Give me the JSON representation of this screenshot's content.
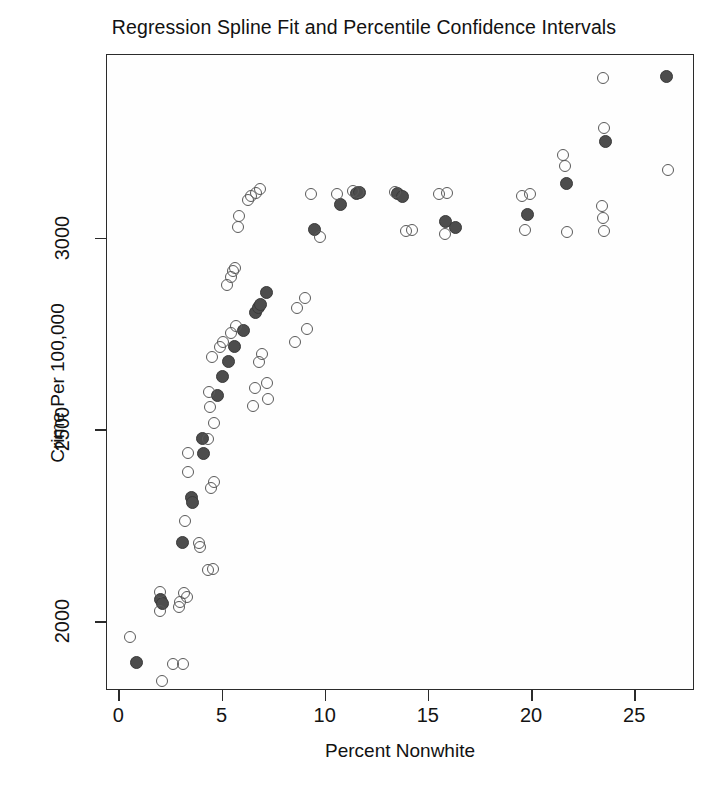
{
  "chart_data": {
    "type": "scatter",
    "title": "Regression Spline Fit and Percentile Confidence Intervals",
    "xlabel": "Percent Nonwhite",
    "ylabel": "Crime Per 100,000",
    "xlim": [
      -0.6,
      27.9
    ],
    "ylim": [
      1820,
      3480
    ],
    "xticks": [
      0,
      5,
      10,
      15,
      20,
      25
    ],
    "yticks": [
      2000,
      2500,
      3000
    ],
    "grid": false,
    "legend": null,
    "series": [
      {
        "name": "Spline fit",
        "marker": "filled-circle",
        "color": "#4d4d4d",
        "points": [
          [
            0.85,
            1895
          ],
          [
            2.0,
            2060
          ],
          [
            2.1,
            2048
          ],
          [
            3.05,
            2207
          ],
          [
            3.5,
            2325
          ],
          [
            3.55,
            2312
          ],
          [
            4.05,
            2478
          ],
          [
            4.1,
            2440
          ],
          [
            4.75,
            2592
          ],
          [
            5.0,
            2640
          ],
          [
            5.3,
            2680
          ],
          [
            5.6,
            2718
          ],
          [
            6.0,
            2762
          ],
          [
            6.6,
            2808
          ],
          [
            6.75,
            2822
          ],
          [
            6.85,
            2830
          ],
          [
            7.15,
            2860
          ],
          [
            9.45,
            3025
          ],
          [
            10.7,
            3090
          ],
          [
            11.5,
            3118
          ],
          [
            11.65,
            3120
          ],
          [
            13.5,
            3118
          ],
          [
            13.7,
            3110
          ],
          [
            15.8,
            3045
          ],
          [
            16.3,
            3030
          ],
          [
            19.8,
            3065
          ],
          [
            21.65,
            3145
          ],
          [
            23.55,
            3255
          ],
          [
            26.5,
            3425
          ]
        ]
      },
      {
        "name": "Percentile confidence interval bounds",
        "marker": "open-circle",
        "color": "#5a5a5a",
        "points": [
          [
            0.5,
            1962
          ],
          [
            1.95,
            2078
          ],
          [
            1.95,
            2030
          ],
          [
            2.05,
            1845
          ],
          [
            2.6,
            1890
          ],
          [
            2.9,
            2040
          ],
          [
            2.95,
            2052
          ],
          [
            3.1,
            1890
          ],
          [
            3.15,
            2075
          ],
          [
            3.3,
            2065
          ],
          [
            3.2,
            2265
          ],
          [
            3.35,
            2440
          ],
          [
            3.35,
            2392
          ],
          [
            3.85,
            2205
          ],
          [
            3.9,
            2195
          ],
          [
            4.3,
            2135
          ],
          [
            4.55,
            2138
          ],
          [
            4.45,
            2350
          ],
          [
            4.6,
            2365
          ],
          [
            4.3,
            2478
          ],
          [
            4.6,
            2520
          ],
          [
            4.35,
            2600
          ],
          [
            4.4,
            2560
          ],
          [
            4.5,
            2692
          ],
          [
            4.9,
            2718
          ],
          [
            5.0,
            2730
          ],
          [
            5.4,
            2755
          ],
          [
            5.65,
            2772
          ],
          [
            5.2,
            2880
          ],
          [
            5.4,
            2900
          ],
          [
            5.5,
            2915
          ],
          [
            5.6,
            2925
          ],
          [
            5.75,
            3030
          ],
          [
            5.8,
            3060
          ],
          [
            6.25,
            3102
          ],
          [
            6.4,
            3112
          ],
          [
            6.6,
            3120
          ],
          [
            6.8,
            3130
          ],
          [
            6.5,
            2565
          ],
          [
            6.55,
            2612
          ],
          [
            6.75,
            2680
          ],
          [
            6.9,
            2700
          ],
          [
            7.15,
            2625
          ],
          [
            7.2,
            2582
          ],
          [
            8.5,
            2730
          ],
          [
            8.6,
            2820
          ],
          [
            9.0,
            2845
          ],
          [
            9.1,
            2765
          ],
          [
            9.3,
            3118
          ],
          [
            9.7,
            3005
          ],
          [
            10.55,
            3118
          ],
          [
            11.3,
            3125
          ],
          [
            11.55,
            3122
          ],
          [
            13.35,
            3122
          ],
          [
            13.9,
            3020
          ],
          [
            14.2,
            3022
          ],
          [
            15.5,
            3118
          ],
          [
            15.9,
            3120
          ],
          [
            15.8,
            3012
          ],
          [
            19.5,
            3112
          ],
          [
            19.9,
            3118
          ],
          [
            19.65,
            3022
          ],
          [
            21.5,
            3220
          ],
          [
            21.6,
            3190
          ],
          [
            23.45,
            3420
          ],
          [
            23.5,
            3290
          ],
          [
            23.4,
            3085
          ],
          [
            23.45,
            3055
          ],
          [
            23.5,
            3020
          ],
          [
            21.7,
            3018
          ],
          [
            26.6,
            3180
          ]
        ]
      }
    ]
  },
  "axes": {
    "x_tick_labels": [
      "0",
      "5",
      "10",
      "15",
      "20",
      "25"
    ],
    "y_tick_labels": [
      "2000",
      "2500",
      "3000"
    ]
  }
}
